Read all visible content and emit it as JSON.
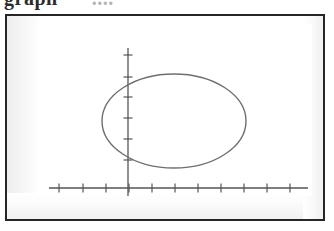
{
  "caption": {
    "clipped_text": "graph",
    "trailing_faint": "...."
  },
  "figure": {
    "background_color": "#ffffff",
    "frame_color": "#262626",
    "panel_color": "#ffffff"
  },
  "chart_data": {
    "type": "line",
    "title": "",
    "subtitle": "",
    "xlabel": "",
    "ylabel": "",
    "legend": [],
    "grid": false,
    "annotations": [],
    "curve_name": "ellipse",
    "curve_color": "#6e6e6e",
    "curve_line_width": 1.4,
    "axis_color": "#555555",
    "axis_line_width": 1.3,
    "tick_color": "#555555",
    "tick_length": 9,
    "x_axis": {
      "visible": true,
      "y_value": 0,
      "pixel_y": 164,
      "pixel_x_start": 12,
      "pixel_x_end": 271,
      "tick_pixels": [
        22,
        46,
        69,
        92,
        115,
        138,
        161,
        184,
        207,
        230,
        253
      ],
      "tick_values": [
        -4,
        -3,
        -2,
        -1,
        0,
        1,
        2,
        3,
        4,
        5,
        6
      ],
      "tick_labels": [],
      "spacing_px": 23,
      "range": [
        -4.3,
        6.8
      ]
    },
    "y_axis": {
      "visible": true,
      "x_value": 0,
      "pixel_x": 91,
      "pixel_y_start": 24,
      "pixel_y_end": 185,
      "tick_pixels": [
        31,
        53,
        73,
        94,
        115,
        136
      ],
      "tick_values": [
        3.5,
        2.8,
        2.1,
        1.4,
        0.7,
        0
      ],
      "tick_labels": [],
      "spacing_px": 21,
      "range": [
        -0.9,
        4.0
      ]
    },
    "ellipse": {
      "center_x_px": 137,
      "center_y_px": 97,
      "radius_x_px": 72,
      "radius_y_px": 47,
      "center_data": [
        2.0,
        3.2
      ],
      "semi_axis_x_data": 3.1,
      "semi_axis_y_data": 2.2,
      "bbox_pixels": {
        "left": 65,
        "right": 209,
        "top": 50,
        "bottom": 144
      },
      "closed": true,
      "filled": false
    }
  }
}
